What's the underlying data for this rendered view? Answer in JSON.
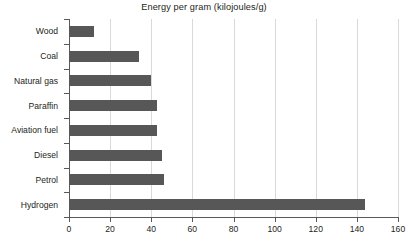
{
  "chart_data": {
    "type": "bar",
    "orientation": "horizontal",
    "title": "Energy per gram (kilojoules/g)",
    "xlabel": "",
    "ylabel": "",
    "categories": [
      "Wood",
      "Coal",
      "Natural gas",
      "Paraffin",
      "Aviation fuel",
      "Diesel",
      "Petrol",
      "Hydrogen"
    ],
    "values": [
      12,
      34,
      40,
      43,
      43,
      45,
      46,
      144
    ],
    "xlim": [
      0,
      160
    ],
    "xticks": [
      0,
      20,
      40,
      60,
      80,
      100,
      120,
      140,
      160
    ],
    "xtick_labels": [
      "0",
      "20",
      "40",
      "60",
      "80",
      "100",
      "120",
      "140",
      "160"
    ],
    "grid": "vertical",
    "legend": "none",
    "bar_color": "#575757",
    "gridline_color": "#d9d9d9",
    "axis_color": "#58595b",
    "background": "#ffffff"
  }
}
